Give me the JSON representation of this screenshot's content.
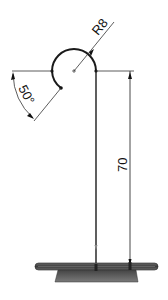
{
  "drawing": {
    "radius_label": "R8",
    "angle_label": "50°",
    "height_label": "70"
  },
  "colors": {
    "line": "#1a1a1a",
    "thin_line": "#333333",
    "base_dark": "#3a3a3a",
    "base_mid": "#5a5a5a"
  }
}
